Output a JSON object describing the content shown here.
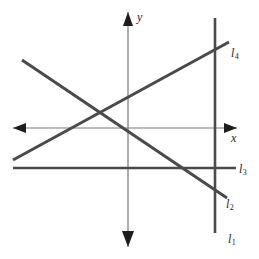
{
  "figure": {
    "width": 259,
    "height": 259,
    "background_color": "#ffffff",
    "line_color": "#4a4a4a",
    "axis_color": "#7a7a7a",
    "label_color": "#1d1d1d"
  },
  "axes": {
    "x_label": "x",
    "y_label": "y",
    "origin": {
      "x": 128,
      "y": 128
    },
    "x_axis": {
      "x1": 13,
      "y1": 128,
      "x2": 237,
      "y2": 128,
      "arrows": "both"
    },
    "y_axis": {
      "x1": 128,
      "y1": 12,
      "x2": 128,
      "y2": 247,
      "arrows": "both"
    }
  },
  "lines": [
    {
      "label": "l",
      "subscript": "1",
      "name": "line-l1",
      "orientation": "vertical",
      "x1": 215,
      "y1": 18,
      "x2": 215,
      "y2": 233
    },
    {
      "label": "l",
      "subscript": "2",
      "name": "line-l2",
      "orientation": "descending",
      "x1": 22,
      "y1": 60,
      "x2": 227,
      "y2": 198
    },
    {
      "label": "l",
      "subscript": "3",
      "name": "line-l3",
      "orientation": "horizontal",
      "x1": 13,
      "y1": 168,
      "x2": 236,
      "y2": 168
    },
    {
      "label": "l",
      "subscript": "4",
      "name": "line-l4",
      "orientation": "ascending",
      "x1": 13,
      "y1": 160,
      "x2": 229,
      "y2": 42
    }
  ],
  "chart_data": {
    "type": "line",
    "xlabel": "x",
    "ylabel": "y",
    "grid": false,
    "legend": "inline-end-labels",
    "series": [
      {
        "name": "l1",
        "description": "vertical line right of y-axis",
        "points": [
          [
            215,
            18
          ],
          [
            215,
            233
          ]
        ]
      },
      {
        "name": "l2",
        "description": "negative slope line",
        "points": [
          [
            22,
            60
          ],
          [
            227,
            198
          ]
        ]
      },
      {
        "name": "l3",
        "description": "horizontal line below x-axis",
        "points": [
          [
            13,
            168
          ],
          [
            236,
            168
          ]
        ]
      },
      {
        "name": "l4",
        "description": "positive slope line",
        "points": [
          [
            13,
            160
          ],
          [
            229,
            42
          ]
        ]
      }
    ]
  }
}
